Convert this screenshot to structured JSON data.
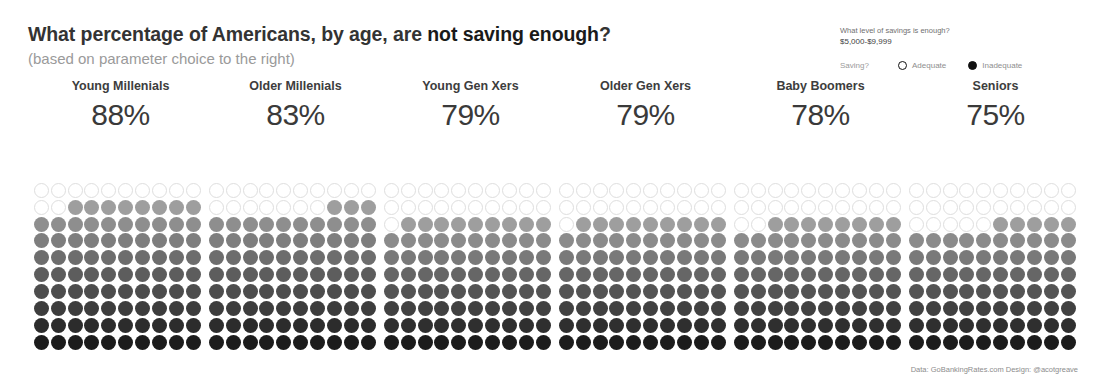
{
  "header": {
    "title_part1": "What percentage of Americans, by age, are ",
    "title_emphasis": "not saving enough",
    "title_part2": "?",
    "subtitle": "(based on parameter choice to the right)"
  },
  "param_panel": {
    "question": "What level of savings is enough?",
    "selected_value": "$5,000-$9,999",
    "legend_label": "Saving?",
    "options": [
      {
        "label": "Adequate",
        "state": "hollow"
      },
      {
        "label": "Inadequate",
        "state": "filled"
      }
    ]
  },
  "footer": {
    "credit": "Data: GoBankingRates.com Design: @acotgreave"
  },
  "chart_data": {
    "type": "bar",
    "subtype": "waffle-grid",
    "title": "What percentage of Americans, by age, are not saving enough?",
    "subtitle": "(based on parameter choice to the right)",
    "xlabel": "",
    "ylabel": "Percent not saving enough",
    "ylim": [
      0,
      100
    ],
    "grid": false,
    "legend_position": "top-right",
    "unit": "%",
    "waffle_rows": 10,
    "waffle_cols": 10,
    "dot_fill_order": "bottom-up",
    "gradient_light": "#9e9e9e",
    "gradient_dark": "#1c1c1c",
    "empty_dot_color": "#ffffff",
    "empty_dot_border": "#dedede",
    "categories": [
      "Young Millenials",
      "Older Millenials",
      "Young Gen Xers",
      "Older Gen Xers",
      "Baby Boomers",
      "Seniors"
    ],
    "values": [
      88,
      83,
      79,
      79,
      78,
      75
    ],
    "series": [
      {
        "name": "Not saving enough",
        "values": [
          88,
          83,
          79,
          79,
          78,
          75
        ]
      }
    ],
    "columns": [
      {
        "label": "Young Millenials",
        "value": 88,
        "value_label": "88%"
      },
      {
        "label": "Older Millenials",
        "value": 83,
        "value_label": "83%"
      },
      {
        "label": "Young Gen Xers",
        "value": 79,
        "value_label": "79%"
      },
      {
        "label": "Older Gen Xers",
        "value": 79,
        "value_label": "79%"
      },
      {
        "label": "Baby Boomers",
        "value": 78,
        "value_label": "78%"
      },
      {
        "label": "Seniors",
        "value": 75,
        "value_label": "75%"
      }
    ]
  }
}
